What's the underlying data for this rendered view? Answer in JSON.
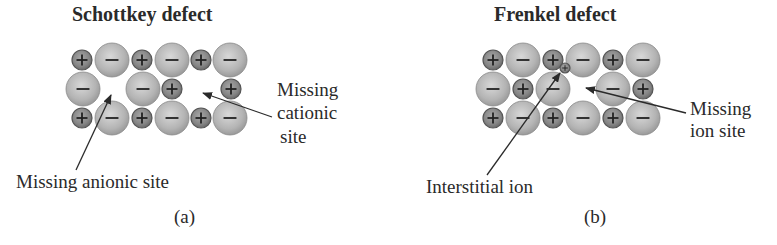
{
  "panels": [
    {
      "id": "a",
      "title": "Schottkey defect",
      "caption": "(a)",
      "labels": {
        "missing_cation_line1": "Missing",
        "missing_cation_line2": "cationic",
        "missing_cation_line3": "site",
        "missing_anion": "Missing anionic site"
      },
      "ions": [
        {
          "row": 1,
          "x": 82,
          "y": 60,
          "charge": "+"
        },
        {
          "row": 1,
          "x": 112,
          "y": 60,
          "charge": "-"
        },
        {
          "row": 1,
          "x": 142,
          "y": 60,
          "charge": "+"
        },
        {
          "row": 1,
          "x": 172,
          "y": 60,
          "charge": "-"
        },
        {
          "row": 1,
          "x": 201,
          "y": 60,
          "charge": "+"
        },
        {
          "row": 1,
          "x": 230,
          "y": 60,
          "charge": "-"
        },
        {
          "row": 2,
          "x": 83,
          "y": 89,
          "charge": "-"
        },
        {
          "row": 2,
          "x": 143,
          "y": 89,
          "charge": "-"
        },
        {
          "row": 2,
          "x": 172,
          "y": 89,
          "charge": "+"
        },
        {
          "row": 2,
          "x": 231,
          "y": 89,
          "charge": "+"
        },
        {
          "row": 3,
          "x": 82,
          "y": 118,
          "charge": "+"
        },
        {
          "row": 3,
          "x": 112,
          "y": 118,
          "charge": "-"
        },
        {
          "row": 3,
          "x": 142,
          "y": 118,
          "charge": "+"
        },
        {
          "row": 3,
          "x": 172,
          "y": 118,
          "charge": "-"
        },
        {
          "row": 3,
          "x": 201,
          "y": 118,
          "charge": "+"
        },
        {
          "row": 3,
          "x": 230,
          "y": 118,
          "charge": "-"
        }
      ]
    },
    {
      "id": "b",
      "title": "Frenkel defect",
      "caption": "(b)",
      "labels": {
        "missing_ion_line1": "Missing",
        "missing_ion_line2": "ion site",
        "interstitial": "Interstitial ion"
      },
      "ions": [
        {
          "row": 1,
          "x": 493,
          "y": 60,
          "charge": "+"
        },
        {
          "row": 1,
          "x": 523,
          "y": 60,
          "charge": "-"
        },
        {
          "row": 1,
          "x": 553,
          "y": 60,
          "charge": "+"
        },
        {
          "row": 1,
          "x": 583,
          "y": 60,
          "charge": "-"
        },
        {
          "row": 1,
          "x": 613,
          "y": 60,
          "charge": "+"
        },
        {
          "row": 1,
          "x": 643,
          "y": 60,
          "charge": "-"
        },
        {
          "row": 2,
          "x": 493,
          "y": 89,
          "charge": "-"
        },
        {
          "row": 2,
          "x": 523,
          "y": 89,
          "charge": "+"
        },
        {
          "row": 2,
          "x": 553,
          "y": 89,
          "charge": "-"
        },
        {
          "row": 2,
          "x": 613,
          "y": 89,
          "charge": "-"
        },
        {
          "row": 2,
          "x": 643,
          "y": 89,
          "charge": "+"
        },
        {
          "row": 3,
          "x": 493,
          "y": 118,
          "charge": "+"
        },
        {
          "row": 3,
          "x": 523,
          "y": 118,
          "charge": "-"
        },
        {
          "row": 3,
          "x": 553,
          "y": 118,
          "charge": "+"
        },
        {
          "row": 3,
          "x": 583,
          "y": 118,
          "charge": "-"
        },
        {
          "row": 3,
          "x": 613,
          "y": 118,
          "charge": "+"
        },
        {
          "row": 3,
          "x": 643,
          "y": 118,
          "charge": "-"
        }
      ],
      "interstitial_ion": {
        "x": 565,
        "y": 68,
        "charge": "+"
      }
    }
  ],
  "legend": {
    "cation_symbol": "+",
    "anion_symbol": "-"
  },
  "colors": {
    "anion_fill": "#b8b8b8",
    "cation_fill": "#8a8a8a",
    "outline": "#5a5a5a",
    "text": "#2a2a2a",
    "arrow": "#2a2a2a"
  }
}
